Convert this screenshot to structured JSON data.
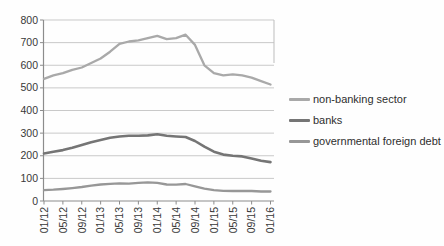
{
  "chart_data": {
    "type": "line",
    "title": "",
    "xlabel": "",
    "ylabel": "",
    "ylim": [
      0,
      800
    ],
    "y_tick_step": 100,
    "y_tick_labels": [
      "0",
      "100",
      "200",
      "300",
      "400",
      "500",
      "600",
      "700",
      "800"
    ],
    "x_tick_labels": [
      "01/12",
      "05/12",
      "09/12",
      "01/13",
      "05/13",
      "09/13",
      "01/14",
      "05/14",
      "09/14",
      "01/15",
      "05/15",
      "09/15",
      "01/16"
    ],
    "x": [
      "01/12",
      "03/12",
      "05/12",
      "07/12",
      "09/12",
      "11/12",
      "01/13",
      "03/13",
      "05/13",
      "07/13",
      "09/13",
      "11/13",
      "01/14",
      "03/14",
      "05/14",
      "07/14",
      "09/14",
      "11/14",
      "01/15",
      "03/15",
      "05/15",
      "07/15",
      "09/15",
      "11/15",
      "01/16"
    ],
    "series": [
      {
        "name": "non-banking sector",
        "color": "#a9a9a9",
        "stroke_width": 2.3,
        "values": [
          540,
          555,
          565,
          580,
          590,
          610,
          630,
          660,
          695,
          705,
          710,
          720,
          730,
          715,
          720,
          735,
          690,
          600,
          565,
          555,
          560,
          555,
          545,
          530,
          515
        ]
      },
      {
        "name": "banks",
        "color": "#757575",
        "stroke_width": 2.6,
        "values": [
          210,
          218,
          225,
          235,
          248,
          260,
          270,
          280,
          285,
          288,
          288,
          290,
          295,
          288,
          285,
          283,
          265,
          240,
          218,
          205,
          200,
          197,
          188,
          178,
          172
        ]
      },
      {
        "name": "governmental foreign debt",
        "color": "#979797",
        "stroke_width": 2.3,
        "values": [
          48,
          50,
          53,
          57,
          62,
          68,
          73,
          76,
          78,
          77,
          80,
          82,
          80,
          73,
          72,
          75,
          65,
          55,
          48,
          45,
          44,
          45,
          44,
          42,
          42
        ]
      }
    ],
    "grid": "horizontal",
    "legend_position": "right"
  },
  "style": {
    "gridline_color": "#c9c9c9",
    "axis_color": "#8c8c8c",
    "tick_label_color": "#383838",
    "right_edge_artifact_color": "#bdbdbd"
  }
}
